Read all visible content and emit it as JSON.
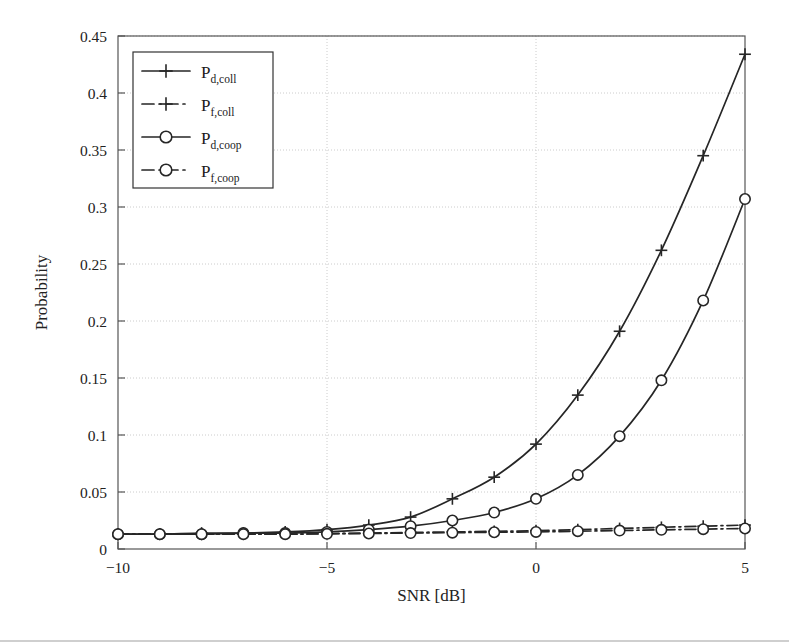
{
  "chart_data": {
    "type": "line",
    "title": "",
    "xlabel": "SNR [dB]",
    "ylabel": "Probability",
    "xlim": [
      -10,
      5
    ],
    "ylim": [
      0,
      0.45
    ],
    "xticks": [
      -10,
      -5,
      0,
      5
    ],
    "xtick_labels": [
      "−10",
      "−5",
      "0",
      "5"
    ],
    "yticks": [
      0,
      0.05,
      0.1,
      0.15,
      0.2,
      0.25,
      0.3,
      0.35,
      0.4,
      0.45
    ],
    "ytick_labels": [
      "0",
      "0.05",
      "0.1",
      "0.15",
      "0.2",
      "0.25",
      "0.3",
      "0.35",
      "0.4",
      "0.45"
    ],
    "grid": true,
    "grid_style": "dotted",
    "legend_position": "upper-left",
    "x": [
      -10,
      -9,
      -8,
      -7,
      -6,
      -5,
      -4,
      -3,
      -2,
      -1,
      0,
      1,
      2,
      3,
      4,
      5
    ],
    "series": [
      {
        "name": "P_d,coll",
        "label_base": "P",
        "label_sub": "d,coll",
        "marker": "plus",
        "line": "solid",
        "color": "#262626",
        "values": [
          0.013,
          0.013,
          0.014,
          0.014,
          0.015,
          0.017,
          0.021,
          0.028,
          0.044,
          0.063,
          0.092,
          0.135,
          0.191,
          0.262,
          0.345,
          0.434
        ]
      },
      {
        "name": "P_f,coll",
        "label_base": "P",
        "label_sub": "f,coll",
        "marker": "plus",
        "line": "dashdot",
        "color": "#262626",
        "values": [
          0.013,
          0.013,
          0.013,
          0.013,
          0.013,
          0.0135,
          0.014,
          0.0145,
          0.015,
          0.0155,
          0.016,
          0.017,
          0.018,
          0.019,
          0.02,
          0.021
        ]
      },
      {
        "name": "P_d,coop",
        "label_base": "P",
        "label_sub": "d,coop",
        "marker": "circle",
        "line": "solid",
        "color": "#262626",
        "values": [
          0.013,
          0.013,
          0.013,
          0.014,
          0.014,
          0.015,
          0.017,
          0.02,
          0.025,
          0.032,
          0.044,
          0.065,
          0.099,
          0.148,
          0.218,
          0.307
        ]
      },
      {
        "name": "P_f,coop",
        "label_base": "P",
        "label_sub": "f,coop",
        "marker": "circle",
        "line": "dashdot",
        "color": "#262626",
        "values": [
          0.013,
          0.013,
          0.013,
          0.013,
          0.013,
          0.0133,
          0.0136,
          0.014,
          0.0143,
          0.0147,
          0.015,
          0.0156,
          0.0162,
          0.0168,
          0.0174,
          0.018
        ]
      }
    ]
  },
  "figure": {
    "axis_color": "#555555",
    "grid_color": "#cccccc",
    "line_color": "#262626",
    "background": "#ffffff"
  }
}
